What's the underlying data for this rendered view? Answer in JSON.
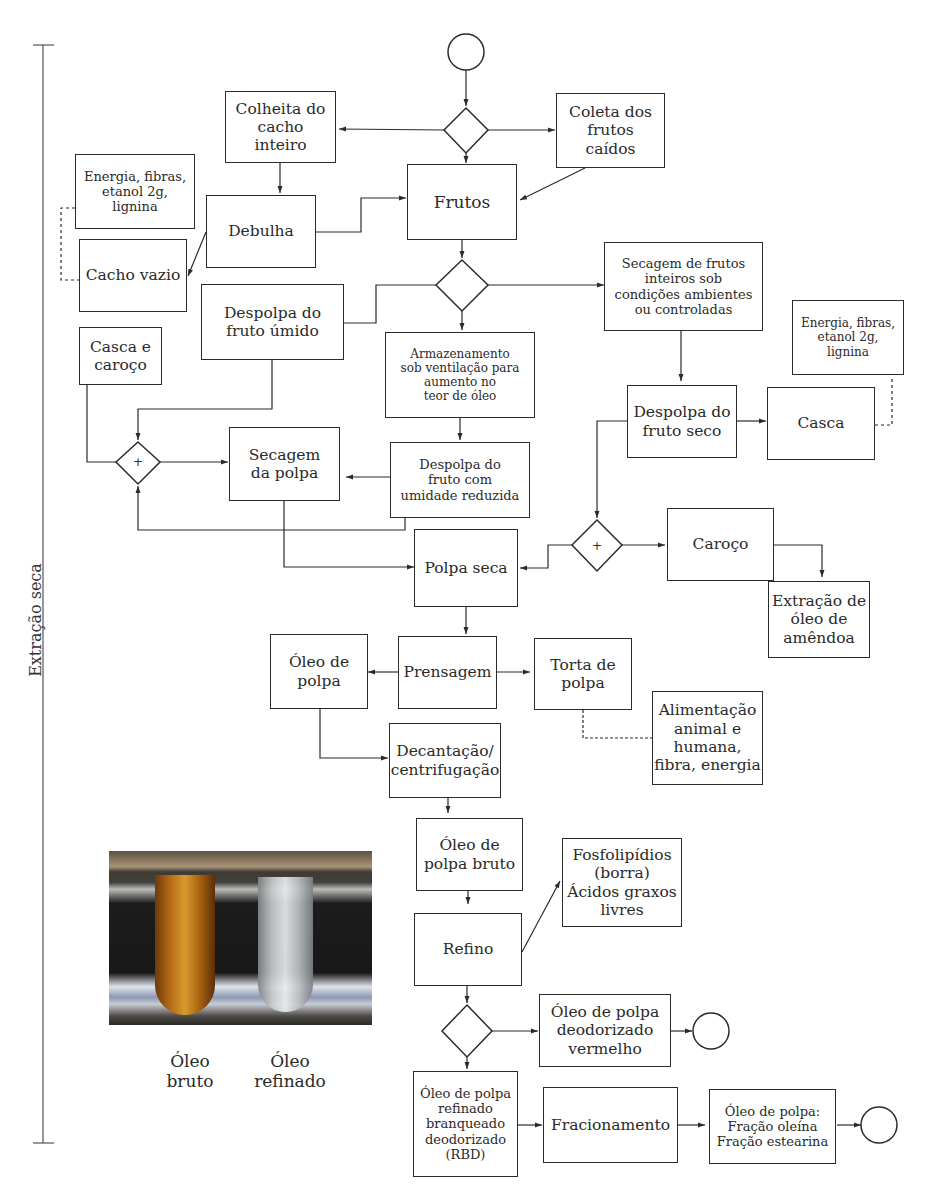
{
  "side_label": "Extração seca",
  "nodes": {
    "colheita": "Colheita do\ncacho\ninteiro",
    "coleta": "Coleta dos\nfrutos\ncaídos",
    "frutos": "Frutos",
    "debulha": "Debulha",
    "subprod_cacho": "Energia, fibras,\netanol 2g,\nlignina",
    "cacho_vazio": "Cacho vazio",
    "despolpa_umido": "Despolpa do\nfruto úmido",
    "armazenamento": "Armazenamento\nsob ventilação para\naumento no\nteor de óleo",
    "secagem_frutos": "Secagem de frutos\ninteiros sob\ncondições ambientes\nou controladas",
    "subprod_casca": "Energia, fibras,\netanol 2g,\nlignina",
    "casca_caroco": "Casca e\ncaroço",
    "secagem_polpa": "Secagem\nda polpa",
    "despolpa_umidade": "Despolpa do\nfruto com\numidade reduzida",
    "despolpa_seco": "Despolpa do\nfruto seco",
    "casca": "Casca",
    "polpa_seca": "Polpa seca",
    "caroco": "Caroço",
    "extracao_amendoa": "Extração de\nóleo de\namêndoa",
    "oleo_polpa": "Óleo de\npolpa",
    "prensagem": "Prensagem",
    "torta": "Torta de\npolpa",
    "alimentacao": "Alimentação\nanimal e\nhumana,\nfibra, energia",
    "decantacao": "Decantação/\ncentrifugação",
    "oleo_bruto": "Óleo de\npolpa bruto",
    "fosfolipidios": "Fosfolipídios\n(borra)\nÁcidos graxos\nlivres",
    "refino": "Refino",
    "deodorizado_vermelho": "Óleo de polpa\ndeodorizado\nvermelho",
    "rbd": "Óleo de polpa\nrefinado\nbranqueado\ndeodorizado\n(RBD)",
    "fracionamento": "Fracionamento",
    "fracoes": "Óleo de polpa:\nFração oleína\nFração estearina"
  },
  "gateway_symbols": {
    "parallel": "+"
  },
  "photo": {
    "caption_left": "Óleo\nbruto",
    "caption_right": "Óleo\nrefinado"
  }
}
